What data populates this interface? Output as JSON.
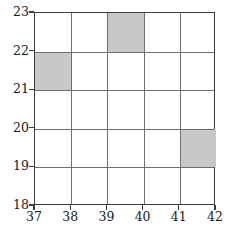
{
  "figure": {
    "clipped_caption_text": ""
  },
  "chart_data": {
    "type": "heatmap",
    "title": "",
    "subtitle": "",
    "xlabel": "",
    "ylabel": "",
    "xlim": [
      37,
      42
    ],
    "ylim": [
      18,
      23
    ],
    "grid": true,
    "legend": null,
    "legend_position": "none",
    "x_tick_labels": [
      "37",
      "38",
      "39",
      "40",
      "41",
      "42"
    ],
    "y_tick_labels": [
      "23",
      "22",
      "21",
      "20",
      "19",
      "18"
    ],
    "x_ticks": [
      37,
      38,
      39,
      40,
      41,
      42
    ],
    "y_ticks": [
      23,
      22,
      21,
      20,
      19,
      18
    ],
    "cell_width": 1,
    "cell_height": 1,
    "columns": 5,
    "rows": 5,
    "empty_color": "#ffffff",
    "filled_color": "#c8c8c8",
    "gridline_color": "#6f6f6f",
    "border_color": "#3d3d3d",
    "filled_cells": [
      {
        "x0": 37,
        "x1": 38,
        "y0": 21,
        "y1": 22,
        "value": 1,
        "label": ""
      },
      {
        "x0": 39,
        "x1": 40,
        "y0": 22,
        "y1": 23,
        "value": 1,
        "label": ""
      },
      {
        "x0": 41,
        "x1": 42,
        "y0": 19,
        "y1": 20,
        "value": 1,
        "label": ""
      }
    ],
    "values": [
      [
        0,
        0,
        1,
        0,
        0
      ],
      [
        1,
        0,
        0,
        0,
        0
      ],
      [
        0,
        0,
        0,
        0,
        0
      ],
      [
        0,
        0,
        0,
        0,
        1
      ],
      [
        0,
        0,
        0,
        0,
        0
      ]
    ],
    "row_bands": [
      "22-23",
      "21-22",
      "20-21",
      "19-20",
      "18-19"
    ],
    "column_bands": [
      "37-38",
      "38-39",
      "39-40",
      "40-41",
      "41-42"
    ]
  }
}
